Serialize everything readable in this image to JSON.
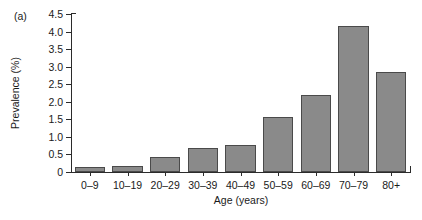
{
  "figure": {
    "panel_label": "(a)",
    "background_color": "#ffffff"
  },
  "chart_data": {
    "type": "bar",
    "title": "",
    "subtitle": "",
    "panel": "(a)",
    "xlabel": "Age (years)",
    "ylabel": "Prevalence (%)",
    "categories": [
      "0–9",
      "10–19",
      "20–29",
      "30–39",
      "40–49",
      "50–59",
      "60–69",
      "70–79",
      "80+"
    ],
    "values": [
      0.14,
      0.17,
      0.44,
      0.67,
      0.78,
      1.57,
      2.2,
      4.16,
      2.85
    ],
    "ylim": [
      0,
      4.5
    ],
    "yticks": [
      0,
      0.5,
      1.0,
      1.5,
      2.0,
      2.5,
      3.0,
      3.5,
      4.0,
      4.5
    ],
    "ytick_labels": [
      "0",
      "0.5",
      "1.0",
      "1.5",
      "2.0",
      "2.5",
      "3.0",
      "3.5",
      "4.0",
      "4.5"
    ],
    "grid": false,
    "legend": null,
    "legend_position": "none",
    "bar_fill_color": "#8a8a8a",
    "bar_edge_color": "#4a4a4a",
    "axis_color": "#2b2b2b"
  }
}
